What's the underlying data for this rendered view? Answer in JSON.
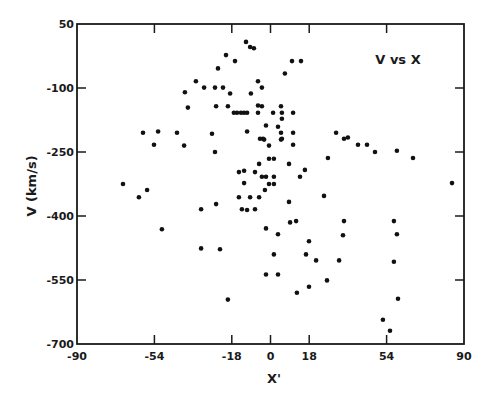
{
  "chart_data": {
    "type": "scatter",
    "title": "V vs X",
    "xlabel": "X'",
    "ylabel": "V (km/s)",
    "xlim": [
      -90,
      90
    ],
    "ylim": [
      -700,
      50
    ],
    "xticks": [
      -90,
      -54,
      -18,
      0,
      18,
      54,
      90
    ],
    "yticks": [
      50,
      -100,
      -250,
      -400,
      -550,
      -700
    ],
    "xtick_labels": [
      "-90",
      "-54",
      "-18",
      "0",
      "18",
      "54",
      "90"
    ],
    "ytick_labels": [
      "50",
      "-100",
      "-250",
      "-400",
      "-550",
      "-700"
    ],
    "grid": false,
    "legend": null,
    "marker_color": "#111111",
    "series": [
      {
        "name": "V vs X",
        "points": [
          [
            -68.6,
            -325
          ],
          [
            -61.2,
            -356
          ],
          [
            -57.4,
            -339
          ],
          [
            -50.5,
            -431
          ],
          [
            -59.3,
            -205
          ],
          [
            -54.2,
            -233
          ],
          [
            -52.3,
            -202
          ],
          [
            -43.5,
            -205
          ],
          [
            -40.2,
            -235
          ],
          [
            -39.8,
            -110
          ],
          [
            -38.4,
            -146
          ],
          [
            -34.7,
            -84
          ],
          [
            -30.9,
            -99
          ],
          [
            -25.8,
            -99
          ],
          [
            -22.1,
            -99
          ],
          [
            -18.8,
            -113
          ],
          [
            -24.4,
            -54
          ],
          [
            -20.7,
            -23
          ],
          [
            -16.5,
            -37
          ],
          [
            -11.4,
            8
          ],
          [
            -9.5,
            -4
          ],
          [
            -7.7,
            -7
          ],
          [
            -9.1,
            -113
          ],
          [
            -5.8,
            -84
          ],
          [
            -4.0,
            -99
          ],
          [
            10.0,
            -37
          ],
          [
            14.2,
            -37
          ],
          [
            6.7,
            -66
          ],
          [
            -25.3,
            -143
          ],
          [
            -19.8,
            -143
          ],
          [
            -17.0,
            -158
          ],
          [
            -15.6,
            -158
          ],
          [
            -13.7,
            -158
          ],
          [
            -12.3,
            -158
          ],
          [
            -10.9,
            -158
          ],
          [
            -5.8,
            -141
          ],
          [
            -4.0,
            -143
          ],
          [
            -5.8,
            -158
          ],
          [
            1.2,
            -158
          ],
          [
            4.9,
            -143
          ],
          [
            5.3,
            -158
          ],
          [
            5.3,
            -172
          ],
          [
            10.5,
            -158
          ],
          [
            -27.2,
            -207
          ],
          [
            -10.9,
            -202
          ],
          [
            -2.1,
            -188
          ],
          [
            3.5,
            -191
          ],
          [
            4.9,
            -205
          ],
          [
            10.5,
            -205
          ],
          [
            -4.9,
            -219
          ],
          [
            -3.5,
            -219
          ],
          [
            5.3,
            -219
          ],
          [
            -3.0,
            -221
          ],
          [
            4.9,
            -221
          ],
          [
            -0.7,
            -235
          ],
          [
            10.5,
            -233
          ],
          [
            -25.8,
            -250
          ],
          [
            -0.7,
            -266
          ],
          [
            1.6,
            -266
          ],
          [
            -5.3,
            -278
          ],
          [
            8.6,
            -278
          ],
          [
            -14.7,
            -297
          ],
          [
            -12.3,
            -294
          ],
          [
            -7.2,
            -297
          ],
          [
            16.0,
            -292
          ],
          [
            13.7,
            -308
          ],
          [
            -4.0,
            -308
          ],
          [
            -2.1,
            -308
          ],
          [
            1.6,
            -308
          ],
          [
            -12.3,
            -323
          ],
          [
            -0.7,
            -325
          ],
          [
            1.6,
            -325
          ],
          [
            -2.6,
            -339
          ],
          [
            -14.7,
            -356
          ],
          [
            -9.5,
            -356
          ],
          [
            -5.3,
            -356
          ],
          [
            -25.3,
            -372
          ],
          [
            8.6,
            -367
          ],
          [
            -32.3,
            -384
          ],
          [
            -13.3,
            -384
          ],
          [
            -10.9,
            -386
          ],
          [
            -7.2,
            -384
          ],
          [
            24.9,
            -353
          ],
          [
            9.1,
            -415
          ],
          [
            11.9,
            -412
          ],
          [
            34.2,
            -412
          ],
          [
            57.4,
            -412
          ],
          [
            -2.1,
            -429
          ],
          [
            3.5,
            -443
          ],
          [
            33.7,
            -445
          ],
          [
            58.8,
            -443
          ],
          [
            17.9,
            -459
          ],
          [
            -32.3,
            -476
          ],
          [
            -23.5,
            -478
          ],
          [
            1.6,
            -490
          ],
          [
            16.5,
            -490
          ],
          [
            21.2,
            -504
          ],
          [
            31.9,
            -504
          ],
          [
            57.4,
            -507
          ],
          [
            -2.1,
            -537
          ],
          [
            3.5,
            -537
          ],
          [
            26.3,
            -551
          ],
          [
            17.9,
            -566
          ],
          [
            12.3,
            -580
          ],
          [
            59.3,
            -594
          ],
          [
            -19.8,
            -596
          ],
          [
            52.3,
            -643
          ],
          [
            55.6,
            -669
          ],
          [
            26.7,
            -264
          ],
          [
            30.5,
            -205
          ],
          [
            34.2,
            -219
          ],
          [
            36.0,
            -216
          ],
          [
            40.7,
            -233
          ],
          [
            44.9,
            -233
          ],
          [
            48.6,
            -250
          ],
          [
            58.8,
            -247
          ],
          [
            66.3,
            -264
          ],
          [
            84.4,
            -323
          ]
        ]
      }
    ]
  }
}
